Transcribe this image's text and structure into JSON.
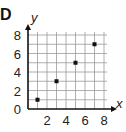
{
  "panel_label": "D",
  "chart_data": {
    "type": "scatter",
    "title": "",
    "xlabel": "x",
    "ylabel": "y",
    "xlim": [
      0,
      8
    ],
    "ylim": [
      0,
      8
    ],
    "grid": true,
    "grid_step": 1,
    "x_ticks": [
      2,
      4,
      6,
      8
    ],
    "y_ticks": [
      0,
      2,
      4,
      6,
      8
    ],
    "points": [
      {
        "x": 1,
        "y": 1
      },
      {
        "x": 3,
        "y": 3
      },
      {
        "x": 5,
        "y": 5
      },
      {
        "x": 7,
        "y": 7
      }
    ]
  }
}
